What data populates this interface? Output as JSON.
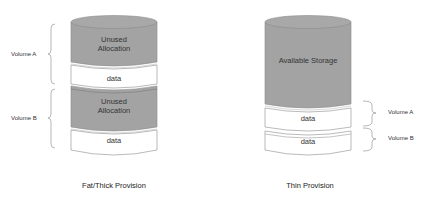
{
  "colors": {
    "unused_fill": "#a3a3a3",
    "top_fill": "#a8a8a8",
    "data_fill": "#ffffff",
    "outline": "#8c8c8c",
    "bracket": "#9a9a9a"
  },
  "left": {
    "caption": "Fat/Thick Provision",
    "volumes": [
      {
        "label": "Volume A",
        "unused_text_1": "Unused",
        "unused_text_2": "Allocation",
        "data_text": "data"
      },
      {
        "label": "Volume B",
        "unused_text_1": "Unused",
        "unused_text_2": "Allocation",
        "data_text": "data"
      }
    ]
  },
  "right": {
    "caption": "Thin Provision",
    "available_text": "Available Storage",
    "volumes": [
      {
        "label": "Volume A",
        "data_text": "data"
      },
      {
        "label": "Volume B",
        "data_text": "data"
      }
    ]
  }
}
